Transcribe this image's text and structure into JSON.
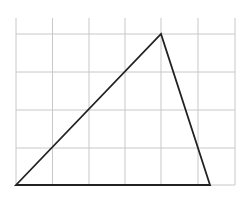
{
  "diagram": {
    "type": "triangle-on-grid",
    "grid": {
      "x_lines": [
        16,
        52.5,
        89,
        125,
        161,
        198,
        235
      ],
      "y_lines": [
        34,
        72,
        110,
        148,
        185
      ],
      "top": 18,
      "bottom": 185,
      "left": 16,
      "right": 235,
      "color": "#c8c8c8"
    },
    "triangle": {
      "vertices": [
        {
          "x": 16,
          "y": 185
        },
        {
          "x": 161,
          "y": 34
        },
        {
          "x": 210,
          "y": 185
        }
      ],
      "stroke": "#222222",
      "stroke_width": 1.8
    }
  }
}
